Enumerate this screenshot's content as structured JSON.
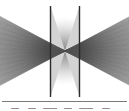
{
  "figure": {
    "background_color": "#ffffff",
    "line_color": "#4a4a4a",
    "band_color": "#2b2b2b",
    "caption_text_color": "#3a3a3a",
    "divider_color": "#7a7a7a",
    "alt": "Grayscale bowtie diffraction pattern with radiating lines converging to a central focus between two vertical bands"
  },
  "caption": {
    "cells": [
      {
        "text": "—",
        "left": 11,
        "width": 9
      },
      {
        "text": "—",
        "left": 28,
        "width": 8
      },
      {
        "text": "——",
        "left": 43,
        "width": 14
      },
      {
        "text": "—",
        "left": 64,
        "width": 8
      },
      {
        "text": "——",
        "left": 79,
        "width": 14
      },
      {
        "text": "—",
        "left": 102,
        "width": 9
      }
    ]
  },
  "chart_data": {
    "type": "scatter",
    "title": "",
    "subtitle": "",
    "xlabel": "",
    "ylabel": "",
    "xlim": [
      0,
      129
    ],
    "ylim": [
      0,
      100
    ],
    "grid": false,
    "legend": null,
    "focal_point": {
      "x": 65,
      "y": 51
    },
    "vertical_bands": [
      {
        "name": "left-band",
        "x": 50.5,
        "y_top": 6,
        "y_bottom": 97,
        "width": 1.4
      },
      {
        "name": "right-band",
        "x": 79.5,
        "y_top": 6,
        "y_bottom": 97,
        "width": 1.4
      }
    ],
    "ray_bundles": [
      {
        "name": "left-bundle",
        "apex": {
          "x": 65,
          "y": 51
        },
        "ray_count": 150,
        "angle_start_deg": 152,
        "angle_end_deg": 208,
        "max_radius": 95
      },
      {
        "name": "right-bundle",
        "apex": {
          "x": 65,
          "y": 51
        },
        "ray_count": 150,
        "angle_start_deg": -28,
        "angle_end_deg": 28,
        "max_radius": 95
      }
    ],
    "wedges": [
      {
        "name": "upper-left-wedge",
        "points": "50.5,6 65,51 50.5,51"
      },
      {
        "name": "upper-right-wedge",
        "points": "79.5,6 65,51 79.5,51"
      },
      {
        "name": "lower-left-wedge",
        "points": "50.5,97 65,51 50.5,51"
      },
      {
        "name": "lower-right-wedge",
        "points": "79.5,97 65,51 79.5,51"
      }
    ]
  }
}
